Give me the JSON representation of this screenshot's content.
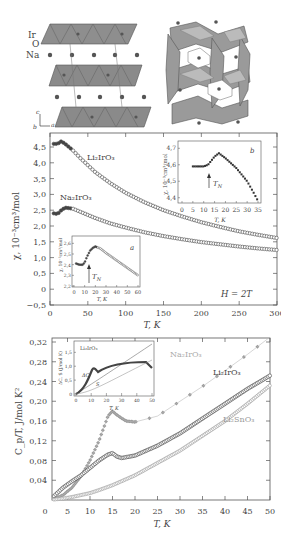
{
  "structure": {
    "atom_labels": [
      "Ir",
      "O",
      "Na"
    ],
    "axes_labels": {
      "c": "c",
      "b": "b",
      "a": "a"
    }
  },
  "chart_data": [
    {
      "type": "scatter",
      "title": "",
      "xlabel": "T, K",
      "ylabel": "χ, 10⁻³cm³/mol",
      "xlim": [
        0,
        300
      ],
      "ylim": [
        -0.5,
        4.8
      ],
      "x_ticks": [
        "0",
        "50",
        "100",
        "150",
        "200",
        "250",
        "300"
      ],
      "y_ticks": [
        "4.5",
        "4.0",
        "3.5",
        "3.0",
        "2.5",
        "2.0",
        "1.5",
        "1.0",
        "0.5",
        "0",
        "−0.5"
      ],
      "annotation": "H = 2T",
      "series": [
        {
          "name": "Li₂IrO₃",
          "x": [
            5,
            10,
            15,
            20,
            30,
            40,
            60,
            80,
            100,
            125,
            150,
            175,
            200,
            225,
            250,
            275,
            300
          ],
          "values": [
            4.6,
            4.6,
            4.68,
            4.6,
            4.4,
            4.15,
            3.7,
            3.35,
            3.05,
            2.75,
            2.5,
            2.3,
            2.12,
            1.97,
            1.83,
            1.72,
            1.62
          ]
        },
        {
          "name": "Na₂IrO₃",
          "x": [
            5,
            10,
            15,
            20,
            30,
            40,
            60,
            80,
            100,
            125,
            150,
            175,
            200,
            225,
            250,
            275,
            300
          ],
          "values": [
            2.4,
            2.38,
            2.5,
            2.58,
            2.55,
            2.45,
            2.25,
            2.08,
            1.95,
            1.8,
            1.68,
            1.58,
            1.49,
            1.42,
            1.35,
            1.29,
            1.24
          ]
        }
      ],
      "insets": [
        {
          "label": "a",
          "xlabel": "T, K",
          "ylabel": "χ, 10⁻³cm³/mol",
          "x_ticks": [
            "0",
            "10",
            "20",
            "30",
            "40",
            "50",
            "60"
          ],
          "y_ticks": [
            "2.2",
            "2.3",
            "2.4",
            "2.5",
            "2.6"
          ],
          "arrow_label": "T_N",
          "x": [
            2,
            5,
            8,
            10,
            12,
            15,
            18,
            20,
            25,
            30,
            40,
            50,
            60
          ],
          "values": [
            2.41,
            2.4,
            2.4,
            2.42,
            2.47,
            2.53,
            2.56,
            2.57,
            2.55,
            2.51,
            2.44,
            2.37,
            2.3
          ]
        },
        {
          "label": "b",
          "xlabel": "T, K",
          "ylabel": "χ, 10⁻³cm³/mol",
          "x_ticks": [
            "0",
            "5",
            "10",
            "15",
            "20",
            "25",
            "30",
            "35"
          ],
          "y_ticks": [
            "4.4",
            "4.5",
            "4.6",
            "4.7"
          ],
          "arrow_label": "T_N",
          "x": [
            5,
            8,
            10,
            12,
            15,
            17,
            20,
            25,
            30,
            33,
            35
          ],
          "values": [
            4.59,
            4.59,
            4.59,
            4.6,
            4.65,
            4.67,
            4.64,
            4.58,
            4.5,
            4.43,
            4.38
          ]
        }
      ]
    },
    {
      "type": "scatter",
      "title": "",
      "xlabel": "T, K",
      "ylabel": "C_p/T, J/mol K²",
      "xlim": [
        0,
        50
      ],
      "ylim": [
        0,
        0.33
      ],
      "x_ticks": [
        "0",
        "5",
        "10",
        "15",
        "20",
        "25",
        "30",
        "35",
        "40",
        "45",
        "50"
      ],
      "y_ticks": [
        "0.32",
        "0.28",
        "0.24",
        "0.20",
        "0.16",
        "0.12",
        "0.08",
        "0.04"
      ],
      "series": [
        {
          "name": "Na₂IrO₃",
          "x": [
            2,
            4,
            6,
            8,
            10,
            12,
            14,
            15,
            16,
            18,
            20,
            25,
            30,
            35,
            40,
            45,
            50
          ],
          "values": [
            0.002,
            0.01,
            0.025,
            0.048,
            0.08,
            0.12,
            0.17,
            0.18,
            0.172,
            0.16,
            0.158,
            0.17,
            0.2,
            0.23,
            0.262,
            0.295,
            0.33
          ]
        },
        {
          "name": "Li₂IrO₃",
          "x": [
            2,
            4,
            6,
            8,
            10,
            12,
            14,
            15,
            16,
            17,
            20,
            25,
            30,
            35,
            40,
            45,
            50
          ],
          "values": [
            0.008,
            0.025,
            0.038,
            0.05,
            0.065,
            0.08,
            0.092,
            0.095,
            0.088,
            0.085,
            0.09,
            0.11,
            0.135,
            0.165,
            0.195,
            0.225,
            0.252
          ]
        },
        {
          "name": "Li₂SnO₃",
          "x": [
            2,
            4,
            6,
            8,
            10,
            12,
            15,
            20,
            25,
            30,
            35,
            40,
            45,
            50
          ],
          "values": [
            0.001,
            0.003,
            0.006,
            0.01,
            0.014,
            0.02,
            0.03,
            0.05,
            0.075,
            0.1,
            0.13,
            0.16,
            0.195,
            0.232
          ]
        }
      ],
      "inset": {
        "title": "Li₂IrO₃",
        "xlabel": "T, K",
        "ylabel": "ΔC, S (J/mol K)",
        "x_ticks": [
          "0",
          "10",
          "20",
          "30",
          "40",
          "50"
        ],
        "y_ticks": [
          "0",
          "0.5",
          "1.0",
          "1.5"
        ],
        "labels": [
          "ΔC",
          "S"
        ]
      }
    }
  ]
}
